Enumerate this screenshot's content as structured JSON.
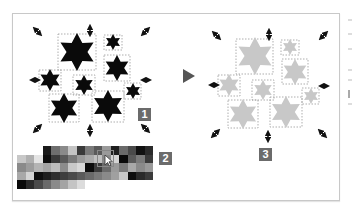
{
  "badges": {
    "b1": "1",
    "b2": "2",
    "b3": "3"
  },
  "colors": {
    "star_black": "#0a0a0a",
    "star_gray": "#c8c8c8",
    "badge_bg": "#6b6b6b",
    "frame_border": "#c8c8c8",
    "arrow": "#555555"
  },
  "swatch_rows": [
    [
      "",
      "",
      "",
      "#1a1a1a",
      "#6e6e6e",
      "#8a8a8a",
      "#c4c4c4",
      "#3a3a3a",
      "#7a7a7a",
      "#5a5a5a",
      "#9a9a9a",
      "#1e1e1e",
      "#6a6a6a",
      "#4a4a4a",
      "#111111",
      "#2a2a2a"
    ],
    [
      "#c8c8c8",
      "#b0b0b0",
      "#e4e4e4",
      "#0e0e0e",
      "#3a3a3a",
      "#5a5a5a",
      "#7a7a7a",
      "#9a9a9a",
      "#aaaaaa",
      "#c0c0c0",
      "#8a8a8a",
      "#d4d4d4",
      "#0a0a0a",
      "#5a5a5a",
      "#7a7a7a",
      "#3a3a3a"
    ],
    [
      "#8a8a8a",
      "#9c9c9c",
      "#b4b4b4",
      "#a4a4a4",
      "#bcbcbc",
      "#8c8c8c",
      "#c8c8c8",
      "#d8d8d8",
      "#0c0c0c",
      "#3c3c3c",
      "#6a6a6a",
      "#9a9a9a",
      "#7a7a7a",
      "#a8a8a8",
      "#8a8a8a",
      "#9a9a9a"
    ],
    [
      "#a8a8a8",
      "#d4d4d4",
      "#0e0e0e",
      "#1e1e1e",
      "#2e2e2e",
      "#3e3e3e",
      "#4a4a4a",
      "#5a5a5a",
      "#6a6a6a",
      "#7a7a7a",
      "#8a8a8a",
      "#a0a0a0",
      "#c8c8c8",
      "#0e0e0e",
      "#2a2a2a",
      "#3a3a3a"
    ],
    [
      "#0a0a0a",
      "#2a2a2a",
      "#4a4a4a",
      "#6a6a6a",
      "#8a8a8a",
      "#a4a4a4",
      "#c4c4c4",
      "#dcdcdc",
      "",
      "",
      "",
      "",
      "",
      "",
      "",
      ""
    ]
  ]
}
